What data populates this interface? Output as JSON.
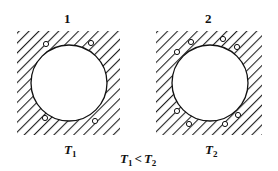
{
  "figure": {
    "panels": [
      {
        "id": "1",
        "label": "1",
        "temperature_symbol": "T",
        "temperature_sub": "1",
        "pore_count": 4
      },
      {
        "id": "2",
        "label": "2",
        "temperature_symbol": "T",
        "temperature_sub": "2",
        "pore_count": 8
      }
    ],
    "comparison": {
      "left_symbol": "T",
      "left_sub": "1",
      "operator": "<",
      "right_symbol": "T",
      "right_sub": "2"
    },
    "colors": {
      "hatch": "#222222",
      "outline": "#111111",
      "background": "#ffffff"
    }
  }
}
